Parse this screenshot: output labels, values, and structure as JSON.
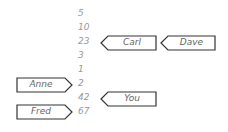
{
  "values": [
    "5",
    "10",
    "23",
    "3",
    "1",
    "2",
    "42",
    "67"
  ],
  "tags": {
    "carl": "Carl",
    "dave": "Dave",
    "anne": "Anne",
    "fred": "Fred",
    "you": "You"
  }
}
